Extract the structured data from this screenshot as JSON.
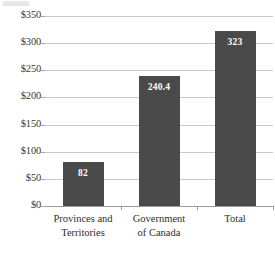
{
  "chart_data": {
    "type": "bar",
    "title": "",
    "subtitle": "",
    "xlabel": "",
    "ylabel": "",
    "categories": [
      "Provinces and Territories",
      "Government of Canada",
      "Total"
    ],
    "category_lines": [
      [
        "Provinces and",
        "Territories"
      ],
      [
        "Government",
        "of Canada"
      ],
      [
        "Total"
      ]
    ],
    "values": [
      82,
      240.4,
      323
    ],
    "value_labels": [
      "82",
      "240.4",
      "323"
    ],
    "ylim": [
      0,
      350
    ],
    "ytick_values": [
      0,
      50,
      100,
      150,
      200,
      250,
      300,
      350
    ],
    "ytick_labels": [
      "$0",
      "$50",
      "$100",
      "$150",
      "$200",
      "$250",
      "$300",
      "$350"
    ],
    "grid": true,
    "legend": "none",
    "bar_color": "#4a4a4a",
    "gridline_color": "#c9c9c9",
    "axis_color": "#9a9a9a",
    "value_label_color": "#ffffff",
    "background_color": "#ffffff"
  }
}
